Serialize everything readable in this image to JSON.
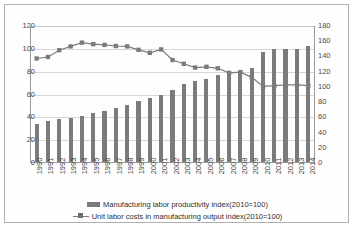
{
  "chart_data": {
    "type": "bar",
    "title": "",
    "xlabel": "",
    "ylabel": "",
    "grid": true,
    "legend_position": "bottom",
    "categories": [
      "1990",
      "1991",
      "1992",
      "1993",
      "1994",
      "1995",
      "1996",
      "1997",
      "1998",
      "1999",
      "2000",
      "2001",
      "2002",
      "2003",
      "2004",
      "2005",
      "2006",
      "2007",
      "2008",
      "2009",
      "2010",
      "2011",
      "2012",
      "2013",
      "2014"
    ],
    "axes": {
      "left": {
        "min": 0,
        "max": 120,
        "step": 20,
        "ticks": [
          "0",
          "20",
          "40",
          "60",
          "80",
          "100",
          "120"
        ]
      },
      "right": {
        "min": 0,
        "max": 180,
        "step": 20,
        "ticks": [
          "0",
          "20",
          "40",
          "60",
          "80",
          "100",
          "120",
          "140",
          "160",
          "180"
        ]
      }
    },
    "series": [
      {
        "name": "Manufacturing labor productivity index(2010=100)",
        "type": "bar",
        "axis": "left",
        "color": "#7b7b7b",
        "values": [
          33,
          36,
          37.5,
          38.5,
          40,
          43,
          45,
          47.5,
          50,
          53.5,
          56.5,
          58.5,
          63,
          68,
          71,
          73,
          76.5,
          79,
          80,
          82.5,
          96,
          99,
          99,
          99,
          102
        ]
      },
      {
        "name": "Unit labor costs in manufacturing output index(2010=100)",
        "type": "line",
        "axis": "right",
        "color": "#7b7b7b",
        "marker": "square",
        "values": [
          137,
          139,
          148,
          153,
          158,
          156,
          155,
          153.5,
          153,
          148.5,
          144.5,
          149,
          135,
          130,
          125,
          126,
          124,
          118,
          119,
          112,
          100,
          101,
          102,
          102,
          101
        ]
      }
    ]
  }
}
